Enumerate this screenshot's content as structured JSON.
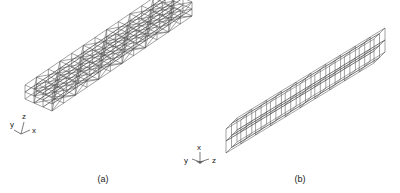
{
  "figure": {
    "panels": [
      {
        "id": "a",
        "caption": "(a)",
        "description": "flat slab wireframe mesh with diagonal bracing",
        "mesh": {
          "cells_long": 12,
          "cells_wide": 3,
          "cells_tall": 2,
          "diagonals": true
        },
        "axes": {
          "labels": [
            "y",
            "z",
            "x"
          ]
        }
      },
      {
        "id": "b",
        "caption": "(b)",
        "description": "square-section beam wireframe mesh",
        "mesh": {
          "cells_long": 10,
          "cells_wide": 2,
          "cells_tall": 2,
          "diagonals": false
        },
        "axes": {
          "labels": [
            "y",
            "x",
            "z"
          ]
        }
      }
    ]
  },
  "colors": {
    "line": "#555555",
    "text": "#222222",
    "background": "#ffffff"
  }
}
